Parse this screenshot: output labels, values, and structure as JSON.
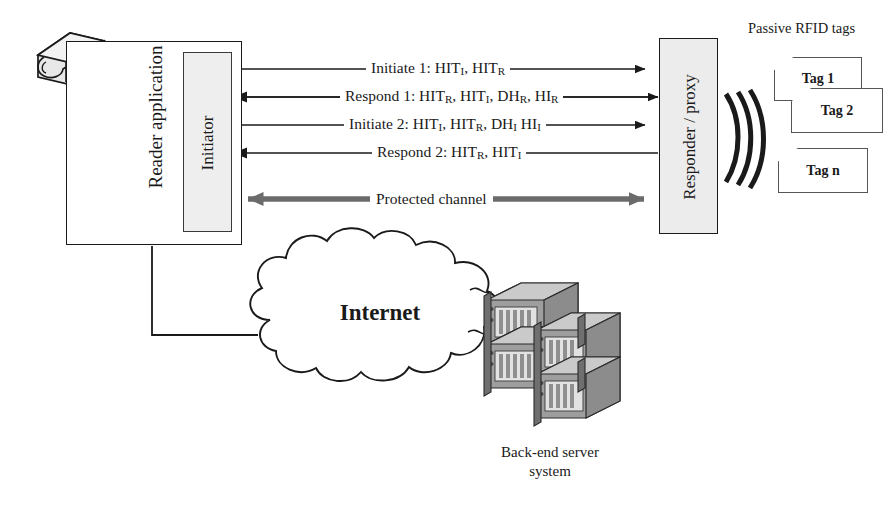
{
  "diagram": {
    "nodes": {
      "reader_application": "Reader application",
      "initiator": "Initiator",
      "responder_proxy": "Responder / proxy",
      "internet": "Internet",
      "backend_server": "Back-end server\nsystem",
      "backend_server_line1": "Back-end server",
      "backend_server_line2": "system",
      "tags_heading": "Passive RFID tags"
    },
    "messages": [
      {
        "id": "initiate-1",
        "direction": "right",
        "color": "#1a1a1a",
        "text": "Initiate 1: HIT",
        "parts": [
          "Initiate 1: HIT",
          "I",
          ", HIT",
          "R"
        ],
        "full": "Initiate 1: HITI, HITR"
      },
      {
        "id": "respond-1",
        "direction": "left",
        "color": "#1a1a1a",
        "parts": [
          "Respond 1: HIT",
          "R",
          ", HIT",
          "I",
          ", DH",
          "R",
          ", HI",
          "R"
        ],
        "full": "Respond 1: HITR, HITI, DHR, HIR"
      },
      {
        "id": "initiate-2",
        "direction": "right",
        "color": "#1a1a1a",
        "parts": [
          "Initiate 2: HIT",
          "I",
          ", HIT",
          "R",
          ", DH",
          "I",
          " HI",
          "I"
        ],
        "full": "Initiate 2: HITI, HITR, DHI HII"
      },
      {
        "id": "respond-2",
        "direction": "left",
        "color": "#1a1a1a",
        "parts": [
          "Respond 2: HIT",
          "R",
          ", HIT",
          "I"
        ],
        "full": "Respond 2: HITR, HITI"
      }
    ],
    "protected_channel": {
      "label": "Protected channel",
      "direction": "both",
      "color": "#666666"
    },
    "tags": [
      {
        "id": "tag-1",
        "label": "Tag 1"
      },
      {
        "id": "tag-2",
        "label": "Tag 2"
      },
      {
        "id": "tag-n",
        "label": "Tag n"
      }
    ],
    "colors": {
      "stroke": "#1a1a1a",
      "box_fill": "#ececec",
      "protected_arrow": "#666666",
      "server_body": "#a8a8a8",
      "server_top": "#c9c9c9",
      "reader_device": "#d8d8d8"
    }
  }
}
